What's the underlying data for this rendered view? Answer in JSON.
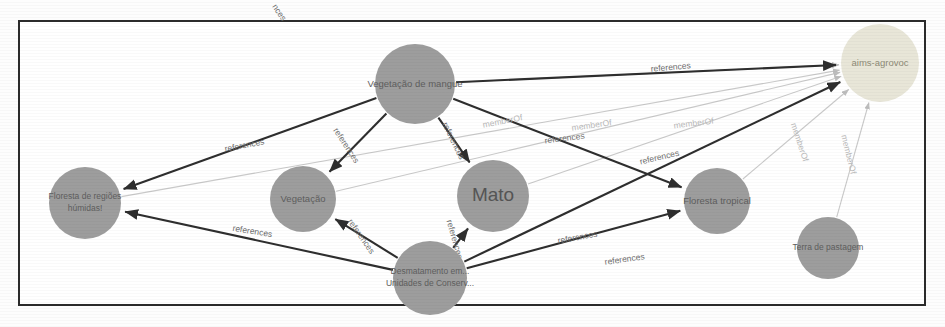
{
  "graph": {
    "title": "Knowledge graph of AGROVOC concept references",
    "background_color": "#ffffff",
    "frame_color": "#2b2b2b",
    "node_color": "#9d9d9d",
    "highlight_node_color": "#e8e6d8",
    "edge_color": "#2e2e2e",
    "faint_edge_color": "#c9c9c9",
    "nodes": [
      {
        "id": "vegetacao-de-mangue",
        "label": "Vegetação de mangue",
        "lines": [
          "Vegetação de mangue"
        ],
        "cx": 415,
        "cy": 84,
        "r": 40,
        "style": "gray",
        "font": "sm"
      },
      {
        "id": "aims-agrovoc",
        "label": "aims-agrovoc",
        "lines": [
          "aims-agrovoc"
        ],
        "cx": 880,
        "cy": 63,
        "r": 39,
        "style": "light",
        "font": "sm"
      },
      {
        "id": "floresta-de-regioes-humidas",
        "label": "Floresta de regiões húmidas!",
        "lines": [
          "Floresta de regiões",
          "húmidas!"
        ],
        "cx": 85,
        "cy": 203,
        "r": 36,
        "style": "gray",
        "font": "xs"
      },
      {
        "id": "vegetacao",
        "label": "Vegetação",
        "lines": [
          "Vegetação"
        ],
        "cx": 303,
        "cy": 199,
        "r": 33,
        "style": "gray",
        "font": "sm"
      },
      {
        "id": "mato",
        "label": "Mato",
        "lines": [
          "Mato"
        ],
        "cx": 493,
        "cy": 196,
        "r": 36,
        "style": "gray",
        "font": "big"
      },
      {
        "id": "floresta-tropical",
        "label": "Floresta tropical",
        "lines": [
          "Floresta tropical"
        ],
        "cx": 717,
        "cy": 201,
        "r": 33,
        "style": "gray",
        "font": "sm"
      },
      {
        "id": "terra-de-pastagem",
        "label": "Terra de pastagem",
        "lines": [
          "Terra de pastagem"
        ],
        "cx": 828,
        "cy": 248,
        "r": 31,
        "style": "gray",
        "font": "xs"
      },
      {
        "id": "desmatamento-unidades-conservacao",
        "label": "Desmatamento em... Unidades de Conserv...",
        "lines": [
          "Desmatamento em...",
          "Unidades de Conserv..."
        ],
        "cx": 430,
        "cy": 278,
        "r": 37,
        "style": "gray",
        "font": "xs"
      }
    ],
    "edges": [
      {
        "id": "e1",
        "source": "vegetacao-de-mangue",
        "target": "aims-agrovoc",
        "label": "references",
        "weight": "strong"
      },
      {
        "id": "e2",
        "source": "vegetacao-de-mangue",
        "target": "floresta-de-regioes-humidas",
        "label": "references",
        "weight": "strong"
      },
      {
        "id": "e3",
        "source": "vegetacao-de-mangue",
        "target": "vegetacao",
        "label": "references",
        "weight": "strong"
      },
      {
        "id": "e4",
        "source": "vegetacao-de-mangue",
        "target": "mato",
        "label": "references",
        "weight": "strong"
      },
      {
        "id": "e5",
        "source": "vegetacao-de-mangue",
        "target": "aims-agrovoc",
        "label": "memberOf",
        "weight": "faint"
      },
      {
        "id": "e6",
        "source": "mato",
        "target": "aims-agrovoc",
        "label": "memberOf",
        "weight": "faint"
      },
      {
        "id": "e7",
        "source": "floresta-tropical",
        "target": "aims-agrovoc",
        "label": "memberOf",
        "weight": "faint"
      },
      {
        "id": "e8",
        "source": "terra-de-pastagem",
        "target": "aims-agrovoc",
        "label": "memberOf",
        "weight": "faint"
      },
      {
        "id": "e9",
        "source": "vegetacao",
        "target": "aims-agrovoc",
        "label": "memberOf",
        "weight": "faint"
      },
      {
        "id": "e10",
        "source": "desmatamento-unidades-conservacao",
        "target": "floresta-de-regioes-humidas",
        "label": "references",
        "weight": "strong"
      },
      {
        "id": "e11",
        "source": "desmatamento-unidades-conservacao",
        "target": "vegetacao",
        "label": "references",
        "weight": "strong"
      },
      {
        "id": "e12",
        "source": "desmatamento-unidades-conservacao",
        "target": "mato",
        "label": "references",
        "weight": "strong"
      },
      {
        "id": "e13",
        "source": "desmatamento-unidades-conservacao",
        "target": "floresta-tropical",
        "label": "references",
        "weight": "strong"
      },
      {
        "id": "e14",
        "source": "desmatamento-unidades-conservacao",
        "target": "aims-agrovoc",
        "label": "references",
        "weight": "strong"
      },
      {
        "id": "e15",
        "source": "vegetacao-de-mangue",
        "target": "floresta-tropical",
        "label": "references",
        "weight": "strong"
      },
      {
        "id": "e16",
        "source": "floresta-de-regioes-humidas",
        "target": "aims-agrovoc",
        "label": "references",
        "weight": "faint"
      },
      {
        "id": "e17",
        "source": "vegetacao-de-mangue",
        "target": "aims-agrovoc",
        "label": "references",
        "weight": "faint"
      }
    ],
    "edge_labels": [
      {
        "id": "l1",
        "text": "references",
        "x": 671,
        "y": 70,
        "rotate": -5
      },
      {
        "id": "l2",
        "text": "references",
        "x": 245,
        "y": 148,
        "rotate": -11
      },
      {
        "id": "l3",
        "text": "references",
        "x": 344,
        "y": 147,
        "rotate": 57
      },
      {
        "id": "l4",
        "text": "references",
        "x": 451,
        "y": 142,
        "rotate": 64
      },
      {
        "id": "l5",
        "text": "memberOf",
        "x": 503,
        "y": 124,
        "rotate": -11
      },
      {
        "id": "l6",
        "text": "memberOf",
        "x": 592,
        "y": 128,
        "rotate": -8
      },
      {
        "id": "l7",
        "text": "memberOf",
        "x": 694,
        "y": 126,
        "rotate": -7
      },
      {
        "id": "l8",
        "text": "references",
        "x": 565,
        "y": 141,
        "rotate": -7
      },
      {
        "id": "l9",
        "text": "references",
        "x": 660,
        "y": 160,
        "rotate": -13
      },
      {
        "id": "l10",
        "text": "memberOf",
        "x": 797,
        "y": 143,
        "rotate": 72
      },
      {
        "id": "l11",
        "text": "memberOf",
        "x": 846,
        "y": 155,
        "rotate": 76
      },
      {
        "id": "l12",
        "text": "references",
        "x": 252,
        "y": 234,
        "rotate": 9
      },
      {
        "id": "l13",
        "text": "references",
        "x": 359,
        "y": 238,
        "rotate": 55
      },
      {
        "id": "l14",
        "text": "references",
        "x": 452,
        "y": 240,
        "rotate": 74
      },
      {
        "id": "l15",
        "text": "references",
        "x": 578,
        "y": 240,
        "rotate": -10
      },
      {
        "id": "l16",
        "text": "references",
        "x": 625,
        "y": 262,
        "rotate": -8
      },
      {
        "id": "l17",
        "text": "nces",
        "x": 277,
        "y": 14,
        "rotate": 56
      }
    ]
  }
}
